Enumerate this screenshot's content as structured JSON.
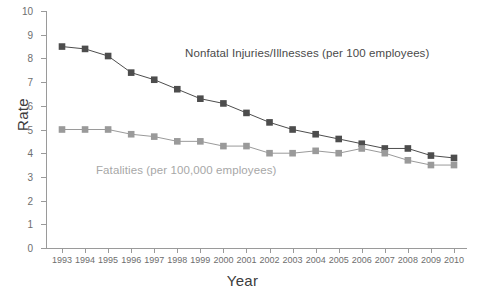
{
  "chart_data": {
    "type": "line",
    "title": "",
    "xlabel": "Year",
    "ylabel": "Rate",
    "xlim": [
      1993,
      2010
    ],
    "ylim": [
      0,
      10
    ],
    "ytick_step": 1,
    "grid": false,
    "legend_position": "inline-annotations",
    "categories": [
      1993,
      1994,
      1995,
      1996,
      1997,
      1998,
      1999,
      2000,
      2001,
      2002,
      2003,
      2004,
      2005,
      2006,
      2007,
      2008,
      2009,
      2010
    ],
    "xtick_labels": [
      "1993",
      "1994",
      "1995",
      "1996",
      "1997",
      "1998",
      "1999",
      "2000",
      "2001",
      "2002",
      "2003",
      "2004",
      "2005",
      "2006",
      "2007",
      "2008",
      "2009",
      "2010"
    ],
    "ytick_labels": [
      "0",
      "1",
      "2",
      "3",
      "4",
      "5",
      "6",
      "7",
      "8",
      "9",
      "10"
    ],
    "series": [
      {
        "name": "Nonfatal Injuries/Illnesses (per 100 employees)",
        "color": "#4d4d4d",
        "marker": "square",
        "values": [
          8.5,
          8.4,
          8.1,
          7.4,
          7.1,
          6.7,
          6.3,
          6.1,
          5.7,
          5.3,
          5.0,
          4.8,
          4.6,
          4.4,
          4.2,
          4.2,
          3.9,
          3.8
        ]
      },
      {
        "name": "Fatalities (per 100,000 employees)",
        "color": "#9a9a9a",
        "marker": "square",
        "values": [
          5.0,
          5.0,
          5.0,
          4.8,
          4.7,
          4.5,
          4.5,
          4.3,
          4.3,
          4.0,
          4.0,
          4.1,
          4.0,
          4.2,
          4.0,
          3.7,
          3.5,
          3.5
        ]
      }
    ],
    "annotations": [
      {
        "text": "Nonfatal Injuries/Illnesses (per 100 employees)",
        "color": "#4a4a4a"
      },
      {
        "text": "Fatalities (per 100,000 employees)",
        "color": "#a7a7a7"
      }
    ]
  },
  "axis": {
    "y_title": "Rate",
    "x_title": "Year"
  },
  "colors": {
    "nonfatal": "#4d4d4d",
    "fatalities": "#9a9a9a",
    "axis": "#9a9a9a",
    "tick_text": "#6e6e6e",
    "background": "#ffffff"
  }
}
